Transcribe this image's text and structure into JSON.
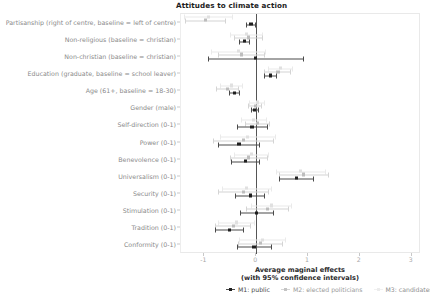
{
  "chart_data": {
    "type": "scatter",
    "title": "Attitudes to climate action",
    "xlabel_line1": "Average maginal effects",
    "xlabel_line2": "(with 95% confidence intervals)",
    "ylabel": "",
    "xlim": [
      -1.45,
      3.18
    ],
    "xticks": [
      -1,
      0,
      1,
      2,
      3
    ],
    "xtick_labels": [
      "-1",
      "0",
      "1",
      "2",
      "3"
    ],
    "grid": false,
    "legend_position": "bottom",
    "zero_reference_line": 0,
    "categories": [
      "Partisanship (right of centre, baseline = left of centre)",
      "Non-religious (baseline = christian)",
      "Non-christian (baseline = christian)",
      "Education (graduate, baseline = school leaver)",
      "Age (61+, baseline = 18-30)",
      "Gender (male)",
      "Self-direction (0-1)",
      "Power (0-1)",
      "Benevolence (0-1)",
      "Universalism (0-1)",
      "Security (0-1)",
      "Stimulation (0-1)",
      "Tradition (0-1)",
      "Conformity (0-1)"
    ],
    "series": [
      {
        "name": "M1: public",
        "key": "m1",
        "color": "#1f1f1f",
        "estimates": [
          -0.1,
          -0.22,
          -0.01,
          0.28,
          -0.42,
          -0.03,
          -0.08,
          -0.33,
          -0.2,
          0.78,
          -0.11,
          0.0,
          -0.51,
          -0.04
        ],
        "ci_low": [
          -0.2,
          -0.33,
          -0.93,
          0.16,
          -0.53,
          -0.1,
          -0.37,
          -0.73,
          -0.48,
          0.44,
          -0.4,
          -0.32,
          -0.79,
          -0.37
        ],
        "ci_high": [
          0.0,
          -0.11,
          0.92,
          0.4,
          -0.31,
          0.05,
          0.22,
          0.07,
          0.07,
          1.12,
          0.18,
          0.34,
          -0.23,
          0.3
        ]
      },
      {
        "name": "M2: elected politicians",
        "key": "m2",
        "color": "#bdbdbd",
        "estimates": [
          -0.98,
          -0.14,
          -0.28,
          0.42,
          -0.55,
          -0.02,
          0.02,
          -0.24,
          -0.14,
          0.92,
          -0.25,
          0.22,
          -0.44,
          0.08
        ],
        "ci_low": [
          -1.38,
          -0.42,
          -0.74,
          0.16,
          -0.77,
          -0.15,
          -0.22,
          -0.83,
          -0.5,
          0.44,
          -0.74,
          -0.19,
          -0.79,
          -0.36
        ],
        "ci_high": [
          -0.58,
          0.14,
          0.18,
          0.68,
          -0.33,
          0.11,
          0.26,
          0.35,
          0.22,
          1.4,
          0.24,
          0.63,
          -0.09,
          0.52
        ]
      },
      {
        "name": "M3: candidates",
        "key": "m3",
        "color": "#e0e0e0",
        "estimates": [
          -0.92,
          -0.18,
          -0.34,
          0.47,
          -0.48,
          0.02,
          -0.05,
          -0.16,
          -0.09,
          0.86,
          -0.18,
          0.3,
          -0.38,
          0.12
        ],
        "ci_low": [
          -1.4,
          -0.5,
          -0.87,
          0.23,
          -0.7,
          -0.13,
          -0.3,
          -0.7,
          -0.42,
          0.38,
          -0.66,
          -0.09,
          -0.73,
          -0.33
        ],
        "ci_high": [
          -0.44,
          0.14,
          0.19,
          0.71,
          -0.26,
          0.17,
          0.2,
          0.38,
          0.24,
          1.34,
          0.3,
          0.69,
          -0.03,
          0.57
        ]
      }
    ]
  }
}
